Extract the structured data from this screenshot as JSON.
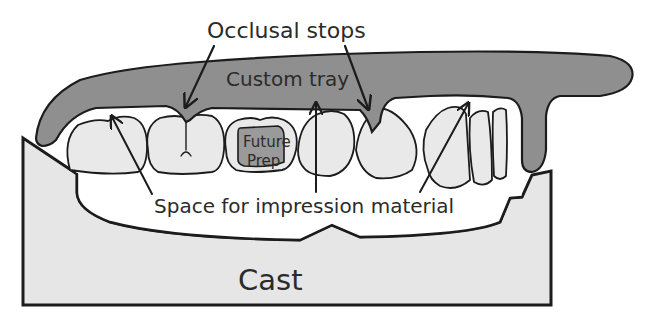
{
  "diagram": {
    "labels": {
      "occlusal_stops": "Occlusal stops",
      "custom_tray": "Custom tray",
      "future_prep_line1": "Future",
      "future_prep_line2": "Prep",
      "space": "Space for impression material",
      "cast": "Cast"
    },
    "colors": {
      "background": "#ffffff",
      "cast_fill": "#e6e6e6",
      "tooth_fill": "#e9e9e9",
      "tray_fill": "#8f8f8f",
      "prep_fill": "#9a9a9a",
      "space_fill": "#ffffff",
      "outline": "#1c1c1c",
      "text": "#2b2b2b"
    }
  }
}
